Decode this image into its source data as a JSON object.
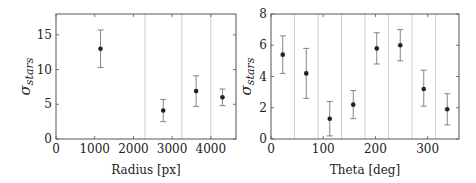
{
  "chart_data": [
    {
      "type": "scatter",
      "title": "",
      "xlabel": "Radius [px]",
      "ylabel": "σ_stars",
      "xlim": [
        0,
        4650
      ],
      "ylim": [
        0,
        18
      ],
      "xticks": [
        0,
        1000,
        2000,
        3000,
        4000
      ],
      "yticks": [
        0,
        5,
        10,
        15
      ],
      "grid": false,
      "bin_boundaries": [
        2300,
        3250,
        4000
      ],
      "series": [
        {
          "name": "sigma_stars",
          "x": [
            1150,
            2770,
            3620,
            4300
          ],
          "y": [
            13.0,
            4.1,
            6.9,
            6.0
          ],
          "yerr_low": [
            10.3,
            2.5,
            4.7,
            4.8
          ],
          "yerr_high": [
            15.7,
            5.7,
            9.1,
            7.2
          ]
        }
      ]
    },
    {
      "type": "scatter",
      "title": "",
      "xlabel": "Theta [deg]",
      "ylabel": "σ_stars",
      "xlim": [
        0,
        360
      ],
      "ylim": [
        0,
        8
      ],
      "xticks": [
        0,
        100,
        200,
        300
      ],
      "yticks": [
        0,
        2,
        4,
        6,
        8
      ],
      "grid": false,
      "bin_boundaries": [
        45,
        90,
        135,
        180,
        225,
        270,
        315
      ],
      "series": [
        {
          "name": "sigma_stars",
          "x": [
            22.5,
            67.5,
            112.5,
            157.5,
            202.5,
            247.5,
            292.5,
            337.5
          ],
          "y": [
            5.4,
            4.2,
            1.3,
            2.2,
            5.8,
            6.0,
            3.2,
            1.9
          ],
          "yerr_low": [
            4.2,
            2.6,
            0.2,
            1.3,
            4.8,
            5.0,
            2.1,
            0.9
          ],
          "yerr_high": [
            6.6,
            5.8,
            2.4,
            3.1,
            6.8,
            7.0,
            4.4,
            2.9
          ]
        }
      ]
    }
  ],
  "labels": {
    "left_xlabel": "Radius [px]",
    "right_xlabel": "Theta [deg]",
    "ylabel_main": "σ",
    "ylabel_sub": "stars"
  },
  "colors": {
    "axis": "#555555",
    "boundary": "#cfcfcf",
    "marker": "#222222",
    "errorbar": "#777777"
  }
}
